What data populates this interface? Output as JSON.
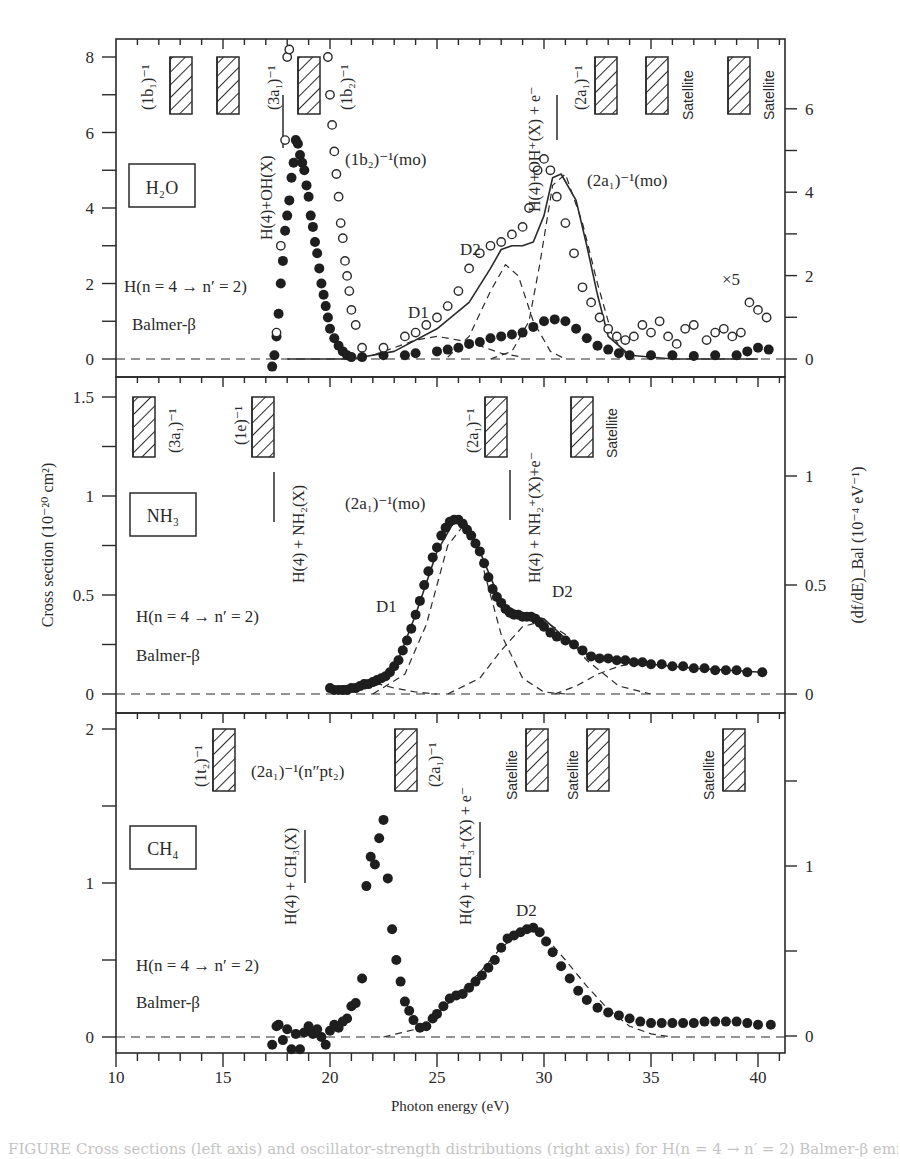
{
  "figure": {
    "xlabel": "Photon energy (eV)",
    "ylabel_left": "Cross section (10⁻²⁰ cm²)",
    "ylabel_right": "(df/dE)_Bal (10⁻⁴ eV⁻¹)",
    "x_ticks": [
      "10",
      "15",
      "20",
      "25",
      "30",
      "35",
      "40"
    ]
  },
  "chart_data": [
    {
      "type": "scatter",
      "panel": "H2O",
      "title": "H₂O",
      "xlabel": "Photon energy (eV)",
      "ylabel": "Cross section (10^-20 cm^2)",
      "ylabel_right": "(df/dE)_Bal (10^-4 eV^-1)",
      "xlim": [
        10,
        41.3
      ],
      "ylim": [
        -0.5,
        8.5
      ],
      "yticks_left": [
        0,
        2,
        4,
        6,
        8
      ],
      "yticks_right": [
        0,
        2,
        4,
        6
      ],
      "annotations": [
        "(1b₁)⁻¹",
        "(3a₁)⁻¹",
        "(1b₂)⁻¹",
        "(2a₁)⁻¹",
        "Satellite",
        "Satellite",
        "H(4)+OH(X)",
        "H(4)+OH⁺(X) + e⁻",
        "(1b₂)⁻¹(mo)",
        "(2a₁)⁻¹(mo)",
        "D1",
        "D2",
        "×5",
        "H(n = 4 → n′ = 2)",
        "Balmer-β"
      ],
      "series": [
        {
          "name": "filled (cross section)",
          "marker": "filled",
          "x": [
            17.3,
            17.4,
            17.5,
            17.6,
            17.7,
            17.8,
            17.9,
            18.0,
            18.1,
            18.2,
            18.3,
            18.4,
            18.5,
            18.6,
            18.7,
            18.8,
            18.9,
            19.0,
            19.1,
            19.2,
            19.3,
            19.4,
            19.5,
            19.6,
            19.7,
            19.8,
            19.9,
            20.0,
            20.2,
            20.4,
            20.6,
            20.8,
            21.0,
            21.5,
            22.5,
            23.5,
            24.0,
            25.0,
            25.5,
            26.0,
            26.5,
            27.0,
            27.5,
            28.0,
            28.5,
            29.0,
            29.5,
            30.0,
            30.5,
            31.0,
            31.5,
            32.0,
            32.5,
            33.0,
            33.5,
            34.0,
            35.0,
            36.0,
            37.0,
            38.0,
            39.0,
            39.5,
            40.0,
            40.5
          ],
          "y": [
            -0.2,
            0.1,
            0.6,
            1.2,
            2.0,
            2.6,
            3.4,
            3.8,
            4.2,
            4.8,
            5.2,
            5.8,
            5.7,
            5.4,
            5.2,
            5.0,
            4.6,
            4.3,
            3.8,
            3.5,
            3.1,
            2.8,
            2.4,
            2.0,
            1.7,
            1.4,
            1.1,
            0.8,
            0.55,
            0.35,
            0.2,
            0.1,
            0.05,
            0.05,
            0.1,
            0.1,
            0.15,
            0.2,
            0.25,
            0.3,
            0.4,
            0.45,
            0.55,
            0.6,
            0.65,
            0.7,
            0.85,
            1.0,
            1.05,
            1.0,
            0.8,
            0.55,
            0.35,
            0.25,
            0.15,
            0.1,
            0.1,
            0.1,
            0.08,
            0.1,
            0.1,
            0.2,
            0.3,
            0.25
          ]
        },
        {
          "name": "open (df/dE, ×5 above 33 eV)",
          "marker": "open",
          "x": [
            17.5,
            17.7,
            17.9,
            18.0,
            18.1,
            19.9,
            20.0,
            20.1,
            20.2,
            20.3,
            20.4,
            20.5,
            20.6,
            20.7,
            20.8,
            20.9,
            21.0,
            21.2,
            21.5,
            22.5,
            23.5,
            24.0,
            24.5,
            25.0,
            25.5,
            26.0,
            26.5,
            27.0,
            27.5,
            28.0,
            28.5,
            29.0,
            29.3,
            29.7,
            30.0,
            30.3,
            30.6,
            31.0,
            31.4,
            31.8,
            32.2,
            32.6,
            33.0,
            33.4,
            33.8,
            34.2,
            34.6,
            35.0,
            35.4,
            35.8,
            36.2,
            36.6,
            37.0,
            37.6,
            38.0,
            38.4,
            38.8,
            39.2,
            39.6,
            40.0,
            40.4
          ],
          "y": [
            0.7,
            3.0,
            5.8,
            8.0,
            8.2,
            8.0,
            7.0,
            6.2,
            5.5,
            4.9,
            4.3,
            3.6,
            3.2,
            2.6,
            2.2,
            1.8,
            1.3,
            0.9,
            0.3,
            0.3,
            0.6,
            0.7,
            0.9,
            1.1,
            1.4,
            1.8,
            2.4,
            2.8,
            3.0,
            3.1,
            3.3,
            3.5,
            4.0,
            5.0,
            5.3,
            5.0,
            4.3,
            3.6,
            2.8,
            1.9,
            1.5,
            1.1,
            0.8,
            0.6,
            0.5,
            0.6,
            0.9,
            0.7,
            1.0,
            0.6,
            0.4,
            0.8,
            0.9,
            0.5,
            0.7,
            0.8,
            0.6,
            0.7,
            1.5,
            1.3,
            1.1
          ]
        },
        {
          "name": "fit total",
          "style": "solid",
          "x": [
            18.0,
            21.0,
            23.0,
            25.0,
            26.5,
            27.5,
            28.0,
            28.5,
            29.0,
            29.5,
            30.0,
            30.4,
            30.8,
            31.5,
            32.0,
            32.5,
            33.0,
            34.0,
            36.0,
            40.0
          ],
          "y": [
            0.0,
            0.0,
            0.2,
            0.8,
            1.5,
            2.4,
            2.9,
            3.0,
            3.0,
            3.1,
            3.8,
            4.8,
            4.9,
            4.2,
            3.0,
            1.7,
            0.6,
            0.1,
            0.0,
            0.0
          ]
        },
        {
          "name": "D1 component",
          "style": "dashed",
          "x": [
            22,
            23,
            24,
            25,
            26,
            27,
            28,
            29
          ],
          "y": [
            0.1,
            0.3,
            0.5,
            0.6,
            0.5,
            0.35,
            0.15,
            0.05
          ]
        },
        {
          "name": "D2 component",
          "style": "dashed",
          "x": [
            25.5,
            26.5,
            27.5,
            28.2,
            28.8,
            29.5,
            30.3,
            31.0
          ],
          "y": [
            0.05,
            0.6,
            1.8,
            2.5,
            2.2,
            1.0,
            0.2,
            0.0
          ]
        },
        {
          "name": "(2a1)^-1(mo) component",
          "style": "dashed",
          "x": [
            27.5,
            28.5,
            29.3,
            29.8,
            30.4,
            31.0,
            31.8,
            32.5,
            33.2,
            34
          ],
          "y": [
            0.0,
            0.2,
            1.0,
            2.5,
            4.6,
            4.9,
            3.6,
            2.0,
            0.6,
            0.0
          ]
        }
      ]
    },
    {
      "type": "scatter",
      "panel": "NH3",
      "title": "NH₃",
      "xlim": [
        10,
        41.3
      ],
      "ylim": [
        -0.1,
        1.6
      ],
      "yticks_left": [
        0,
        0.5,
        1,
        1.5
      ],
      "yticks_right": [
        0,
        0.5,
        1
      ],
      "annotations": [
        "(3a₁)⁻¹",
        "(1e)⁻¹",
        "(2a₁)⁻¹",
        "Satellite",
        "H(4) + NH₂(X)",
        "H(4) + NH₂⁺(X)+e⁻",
        "(2a₁)⁻¹(mo)",
        "D1",
        "D2",
        "H(n = 4 → n′ = 2)",
        "Balmer-β"
      ],
      "series": [
        {
          "name": "filled (cross section)",
          "marker": "filled",
          "x": [
            20.0,
            20.2,
            20.4,
            20.6,
            20.8,
            21.0,
            21.2,
            21.4,
            21.6,
            21.8,
            22.0,
            22.2,
            22.4,
            22.6,
            22.8,
            23.0,
            23.2,
            23.4,
            23.6,
            23.8,
            24.0,
            24.2,
            24.4,
            24.6,
            24.8,
            25.0,
            25.2,
            25.4,
            25.6,
            25.8,
            26.0,
            26.2,
            26.4,
            26.6,
            26.8,
            27.0,
            27.2,
            27.4,
            27.6,
            27.8,
            28.0,
            28.2,
            28.4,
            28.6,
            28.8,
            29.0,
            29.2,
            29.4,
            29.6,
            29.8,
            30.0,
            30.3,
            30.6,
            31.0,
            31.4,
            31.8,
            32.2,
            32.6,
            33.0,
            33.4,
            33.8,
            34.2,
            34.6,
            35.0,
            35.5,
            36.0,
            36.5,
            37.0,
            37.5,
            38.0,
            38.5,
            39.0,
            39.5,
            40.2
          ],
          "y": [
            0.03,
            0.02,
            0.02,
            0.02,
            0.02,
            0.03,
            0.03,
            0.04,
            0.05,
            0.05,
            0.06,
            0.07,
            0.08,
            0.09,
            0.11,
            0.14,
            0.17,
            0.22,
            0.27,
            0.33,
            0.4,
            0.47,
            0.55,
            0.62,
            0.69,
            0.74,
            0.8,
            0.84,
            0.87,
            0.88,
            0.88,
            0.86,
            0.83,
            0.8,
            0.76,
            0.72,
            0.66,
            0.59,
            0.53,
            0.49,
            0.46,
            0.43,
            0.41,
            0.4,
            0.4,
            0.39,
            0.39,
            0.39,
            0.38,
            0.36,
            0.34,
            0.31,
            0.29,
            0.27,
            0.25,
            0.22,
            0.19,
            0.18,
            0.18,
            0.17,
            0.17,
            0.16,
            0.16,
            0.15,
            0.15,
            0.14,
            0.14,
            0.13,
            0.13,
            0.12,
            0.12,
            0.12,
            0.11,
            0.11
          ]
        },
        {
          "name": "fit total",
          "style": "solid",
          "x": [
            20,
            22,
            23,
            24,
            25,
            25.8,
            26.3,
            27,
            28,
            29,
            30,
            31,
            32,
            33,
            35,
            37,
            40.2
          ],
          "y": [
            0.03,
            0.06,
            0.12,
            0.4,
            0.72,
            0.87,
            0.88,
            0.72,
            0.46,
            0.4,
            0.38,
            0.28,
            0.2,
            0.18,
            0.15,
            0.13,
            0.11
          ]
        },
        {
          "name": "D1 component",
          "style": "dashed",
          "x": [
            20.5,
            21.5,
            22.3,
            23.0,
            24.0,
            25.0
          ],
          "y": [
            0.0,
            0.02,
            0.05,
            0.03,
            0.01,
            0.0
          ]
        },
        {
          "name": "(2a1)^-1(mo) component",
          "style": "dashed",
          "x": [
            22,
            23.5,
            24.5,
            25.5,
            26.3,
            27.0,
            28.0,
            29.0,
            30.0,
            31.0
          ],
          "y": [
            0.0,
            0.1,
            0.35,
            0.75,
            0.86,
            0.7,
            0.3,
            0.08,
            0.01,
            0.0
          ]
        },
        {
          "name": "D2 component",
          "style": "dashed",
          "x": [
            25.5,
            27,
            28,
            29,
            30,
            31,
            32,
            33.5,
            35
          ],
          "y": [
            0.0,
            0.08,
            0.22,
            0.34,
            0.37,
            0.3,
            0.17,
            0.04,
            0.0
          ]
        },
        {
          "name": "high-energy component",
          "style": "dashed",
          "x": [
            30.5,
            31.5,
            32.5,
            33.5,
            34.5,
            35
          ],
          "y": [
            0.0,
            0.04,
            0.1,
            0.14,
            0.16,
            0.16
          ]
        }
      ]
    },
    {
      "type": "scatter",
      "panel": "CH4",
      "title": "CH₄",
      "xlim": [
        10,
        41.3
      ],
      "ylim": [
        -0.1,
        2.1
      ],
      "yticks_left": [
        0,
        1,
        2
      ],
      "yticks_right": [
        0,
        1
      ],
      "annotations": [
        "(1t₂)⁻¹",
        "(2a₁)⁻¹(n″pt₂)",
        "(2a₁)⁻¹",
        "Satellite",
        "Satellite",
        "Satellite",
        "H(4) + CH₃(X)",
        "H(4) + CH₃⁺(X) + e⁻",
        "D2",
        "H(n = 4 → n′ = 2)",
        "Balmer-β"
      ],
      "series": [
        {
          "name": "filled (cross section)",
          "marker": "filled",
          "x": [
            17.3,
            17.5,
            17.6,
            17.8,
            18.0,
            18.2,
            18.4,
            18.6,
            18.8,
            19.0,
            19.2,
            19.4,
            19.6,
            19.8,
            20.0,
            20.2,
            20.4,
            20.6,
            20.8,
            21.0,
            21.2,
            21.5,
            21.7,
            21.9,
            22.1,
            22.3,
            22.5,
            22.7,
            22.9,
            23.1,
            23.3,
            23.5,
            23.7,
            23.9,
            24.2,
            24.5,
            24.8,
            25.0,
            25.3,
            25.6,
            25.9,
            26.2,
            26.5,
            26.8,
            27.1,
            27.4,
            27.7,
            28.0,
            28.3,
            28.6,
            28.9,
            29.2,
            29.5,
            29.8,
            30.1,
            30.4,
            30.8,
            31.2,
            31.6,
            32.0,
            32.5,
            33.0,
            33.5,
            34.0,
            34.5,
            35.0,
            35.5,
            36.0,
            36.5,
            37.0,
            37.5,
            38.0,
            38.5,
            39.0,
            39.5,
            40.0,
            40.6
          ],
          "y": [
            -0.05,
            0.07,
            0.08,
            -0.02,
            0.05,
            -0.08,
            0.02,
            -0.08,
            0.03,
            0.07,
            0.02,
            0.05,
            0.0,
            -0.05,
            0.04,
            0.08,
            0.06,
            0.1,
            0.12,
            0.2,
            0.22,
            0.38,
            0.98,
            1.17,
            1.12,
            1.29,
            1.41,
            1.03,
            0.7,
            0.5,
            0.36,
            0.23,
            0.17,
            0.11,
            0.06,
            0.07,
            0.12,
            0.15,
            0.2,
            0.25,
            0.27,
            0.28,
            0.32,
            0.36,
            0.4,
            0.45,
            0.5,
            0.58,
            0.64,
            0.66,
            0.68,
            0.7,
            0.71,
            0.68,
            0.62,
            0.55,
            0.46,
            0.38,
            0.3,
            0.24,
            0.19,
            0.16,
            0.14,
            0.12,
            0.1,
            0.09,
            0.09,
            0.09,
            0.09,
            0.09,
            0.1,
            0.1,
            0.1,
            0.1,
            0.09,
            0.08,
            0.08
          ]
        },
        {
          "name": "D2 component",
          "style": "dashed",
          "x": [
            22.5,
            24,
            25,
            26,
            27,
            28,
            29,
            29.5,
            30,
            31,
            32,
            33,
            34,
            35,
            36
          ],
          "y": [
            0.0,
            0.05,
            0.15,
            0.28,
            0.42,
            0.58,
            0.69,
            0.7,
            0.66,
            0.5,
            0.33,
            0.18,
            0.07,
            0.02,
            0.0
          ]
        }
      ]
    }
  ],
  "panels": {
    "h2o": {
      "label": "H₂O",
      "left_ticks": [
        "0",
        "2",
        "4",
        "6",
        "8"
      ],
      "right_ticks": [
        "0",
        "2",
        "4",
        "6"
      ],
      "transition": "H(n = 4 → n′ = 2)",
      "balmer": "Balmer-β",
      "thr_1b1": "(1b₁)⁻¹",
      "thr_3a1": "(3a₁)⁻¹",
      "thr_1b2": "(1b₂)⁻¹",
      "thr_2a1": "(2a₁)⁻¹",
      "satellite1": "Satellite",
      "satellite2": "Satellite",
      "dissoc_neutral": "H(4)+OH(X)",
      "dissoc_ion": "H(4)+OH⁺(X) + e⁻",
      "mo_1b2": "(1b₂)⁻¹(mo)",
      "mo_2a1": "(2a₁)⁻¹(mo)",
      "d1": "D1",
      "d2": "D2",
      "x5": "×5"
    },
    "nh3": {
      "label": "NH₃",
      "left_ticks": [
        "0",
        "0.5",
        "1",
        "1.5"
      ],
      "right_ticks": [
        "0",
        "0.5",
        "1"
      ],
      "transition": "H(n = 4 → n′ = 2)",
      "balmer": "Balmer-β",
      "thr_3a1": "(3a₁)⁻¹",
      "thr_1e": "(1e)⁻¹",
      "thr_2a1": "(2a₁)⁻¹",
      "satellite": "Satellite",
      "dissoc_neutral": "H(4) + NH₂(X)",
      "dissoc_ion": "H(4) + NH₂⁺(X)+e⁻",
      "mo_2a1": "(2a₁)⁻¹(mo)",
      "d1": "D1",
      "d2": "D2"
    },
    "ch4": {
      "label": "CH₄",
      "left_ticks": [
        "0",
        "1",
        "2"
      ],
      "right_ticks": [
        "0",
        "1"
      ],
      "transition": "H(n = 4 → n′ = 2)",
      "balmer": "Balmer-β",
      "thr_1t2": "(1t₂)⁻¹",
      "rydberg": "(2a₁)⁻¹(n″pt₂)",
      "thr_2a1": "(2a₁)⁻¹",
      "satellite1": "Satellite",
      "satellite2": "Satellite",
      "satellite3": "Satellite",
      "dissoc_neutral": "H(4) + CH₃(X)",
      "dissoc_ion": "H(4) + CH₃⁺(X) + e⁻",
      "d2": "D2"
    }
  },
  "caption": "FIGURE  Cross sections (left axis) and oscillator-strength distributions (right axis) for H(n = 4 → n′ = 2) Balmer-β emission"
}
